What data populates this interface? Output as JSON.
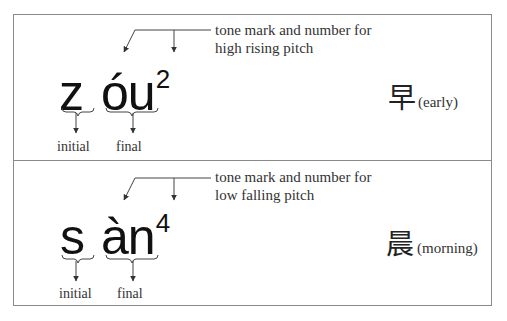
{
  "examples": [
    {
      "initial": "z",
      "final": "óu",
      "tone_number": "2",
      "note_line1": "tone mark and number for",
      "note_line2": "high rising pitch",
      "character": "早",
      "meaning": "(early)",
      "initial_label": "initial",
      "final_label": "final"
    },
    {
      "initial": "s",
      "final": "àn",
      "tone_number": "4",
      "note_line1": "tone mark and number for",
      "note_line2": "low falling pitch",
      "character": "晨",
      "meaning": "(morning)",
      "initial_label": "initial",
      "final_label": "final"
    }
  ],
  "colors": {
    "border": "#8a8a8a",
    "text": "#333333",
    "ink": "#111111"
  }
}
